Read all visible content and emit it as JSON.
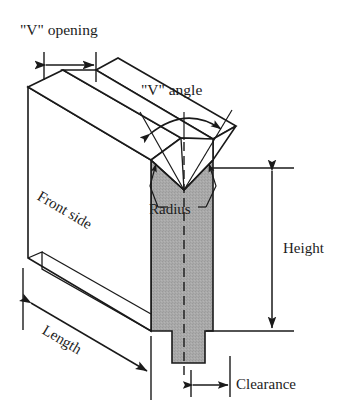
{
  "figure": {
    "kind": "engineering-diagram",
    "background_color": "#ffffff",
    "line_color": "#1a1a1a",
    "shading_color": "#a9a9a9",
    "shading_color_dark": "#9b9b9b"
  },
  "labels": {
    "v_opening": "\"V\" opening",
    "v_angle": "\"V\" angle",
    "radius": "Radius",
    "front_side": "Front side",
    "height": "Height",
    "length": "Length",
    "clearance": "Clearance"
  },
  "dimensions": [
    {
      "id": "v-opening",
      "label": "\"V\" opening",
      "orientation": "horizontal",
      "position": "top-left",
      "arrowheads": "both",
      "from_px": [
        44,
        65
      ],
      "to_px": [
        96,
        65
      ]
    },
    {
      "id": "v-angle",
      "label": "\"V\" angle",
      "orientation": "angular-arc",
      "position": "top-center",
      "arrowheads": "both",
      "vertex_px": [
        184,
        190
      ]
    },
    {
      "id": "radius",
      "label": "Radius",
      "orientation": "leader",
      "position": "center",
      "arrowheads": "both",
      "targets_px": [
        [
          157,
          163
        ],
        [
          211,
          163
        ]
      ]
    },
    {
      "id": "height",
      "label": "Height",
      "orientation": "vertical",
      "position": "right",
      "arrowheads": "both",
      "from_px": [
        272,
        168
      ],
      "to_px": [
        272,
        330
      ]
    },
    {
      "id": "length",
      "label": "Length",
      "orientation": "diagonal",
      "position": "bottom-left",
      "arrowheads": "both",
      "from_px": [
        33,
        304
      ],
      "to_px": [
        148,
        372
      ]
    },
    {
      "id": "clearance",
      "label": "Clearance",
      "orientation": "horizontal",
      "position": "bottom-right",
      "arrowheads": "both",
      "from_px": [
        191,
        385
      ],
      "to_px": [
        230,
        385
      ]
    }
  ],
  "part_faces": [
    {
      "id": "front-side",
      "label": "Front side",
      "shading": "white",
      "rotation_deg": -32
    },
    {
      "id": "die-section",
      "label": "",
      "shading": "grey"
    },
    {
      "id": "top-face",
      "label": "",
      "shading": "white"
    },
    {
      "id": "v-groove",
      "label": "",
      "shading": "white"
    }
  ],
  "geometry": {
    "note": "Coordinates in screenshot pixel space, 355x416",
    "block_top_left": [
      28,
      87
    ],
    "block_bottom_left": [
      28,
      258
    ],
    "die_left_edge_x": 151,
    "die_right_edge_x": 213,
    "die_top_y": 160,
    "die_bottom_y": 331,
    "notch_vertex": [
      184,
      190
    ],
    "tang_left_x": 172,
    "tang_right_x": 205,
    "tang_bottom_y": 363,
    "centerline_x": 184
  }
}
